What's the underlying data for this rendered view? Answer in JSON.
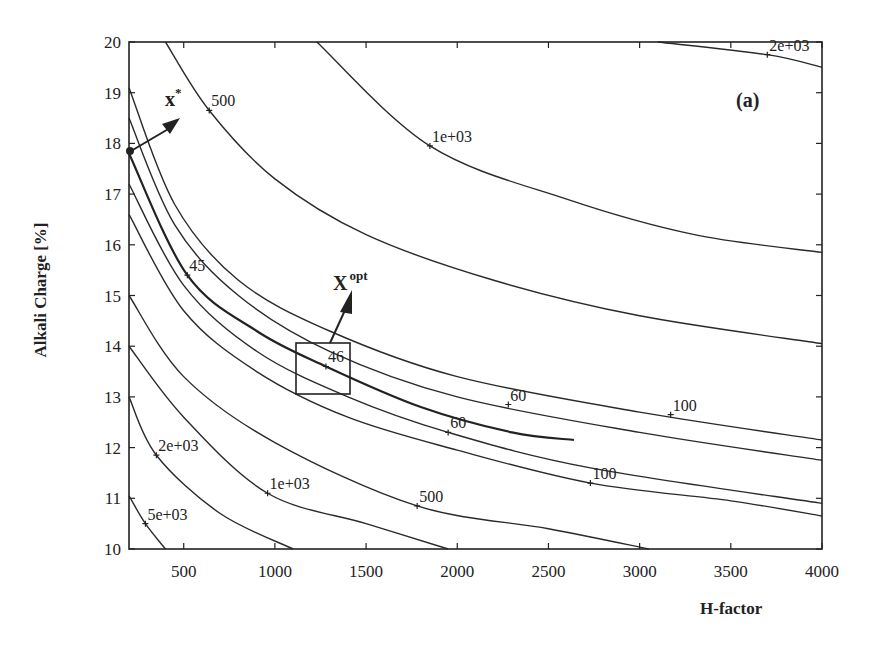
{
  "chart_data": {
    "type": "contour",
    "title": "",
    "panel_label": "(a)",
    "xlabel": "H-factor",
    "ylabel": "Alkali Charge [%]",
    "xlim": [
      200,
      4000
    ],
    "ylim": [
      10,
      20
    ],
    "xticks": [
      500,
      1000,
      1500,
      2000,
      2500,
      3000,
      3500,
      4000
    ],
    "yticks": [
      10,
      11,
      12,
      13,
      14,
      15,
      16,
      17,
      18,
      19,
      20
    ],
    "grid": false,
    "contour_labels": [
      {
        "text": "500",
        "x": 640,
        "y": 18.65
      },
      {
        "text": "1e+03",
        "x": 1850,
        "y": 17.95
      },
      {
        "text": "2e+03",
        "x": 3700,
        "y": 19.75
      },
      {
        "text": "45",
        "x": 520,
        "y": 15.4
      },
      {
        "text": "46",
        "x": 1280,
        "y": 13.6
      },
      {
        "text": "60",
        "x": 2280,
        "y": 12.85
      },
      {
        "text": "60",
        "x": 1950,
        "y": 12.3
      },
      {
        "text": "100",
        "x": 3170,
        "y": 12.65
      },
      {
        "text": "100",
        "x": 2730,
        "y": 11.3
      },
      {
        "text": "2e+03",
        "x": 350,
        "y": 11.85
      },
      {
        "text": "1e+03",
        "x": 960,
        "y": 11.1
      },
      {
        "text": "500",
        "x": 1780,
        "y": 10.85
      },
      {
        "text": "5e+03",
        "x": 290,
        "y": 10.5
      }
    ],
    "contours": [
      {
        "level": "2e+03 (upper)",
        "points": [
          [
            3100,
            20.0
          ],
          [
            3700,
            19.75
          ],
          [
            4000,
            19.5
          ]
        ]
      },
      {
        "level": "1e+03 (upper)",
        "points": [
          [
            1230,
            20.0
          ],
          [
            1850,
            17.95
          ],
          [
            2600,
            16.9
          ],
          [
            3300,
            16.2
          ],
          [
            4000,
            15.85
          ]
        ]
      },
      {
        "level": "500 (upper)",
        "points": [
          [
            400,
            20.0
          ],
          [
            640,
            18.65
          ],
          [
            1000,
            17.3
          ],
          [
            1500,
            16.2
          ],
          [
            2200,
            15.3
          ],
          [
            3000,
            14.6
          ],
          [
            4000,
            14.05
          ]
        ]
      },
      {
        "level": "upper-1",
        "points": [
          [
            200,
            19.1
          ],
          [
            450,
            16.8
          ],
          [
            800,
            15.3
          ],
          [
            1300,
            14.3
          ],
          [
            2000,
            13.4
          ],
          [
            3000,
            12.7
          ],
          [
            4000,
            12.15
          ]
        ]
      },
      {
        "level": "upper-2",
        "points": [
          [
            200,
            18.5
          ],
          [
            450,
            16.4
          ],
          [
            800,
            15.0
          ],
          [
            1300,
            13.9
          ],
          [
            2000,
            13.0
          ],
          [
            3000,
            12.3
          ],
          [
            4000,
            11.75
          ]
        ]
      },
      {
        "level": "45/46 band",
        "points": [
          [
            200,
            17.8
          ],
          [
            520,
            15.4
          ],
          [
            900,
            14.3
          ],
          [
            1280,
            13.6
          ],
          [
            1800,
            12.8
          ],
          [
            2300,
            12.3
          ],
          [
            2640,
            12.15
          ]
        ]
      },
      {
        "level": "60 (lower)",
        "points": [
          [
            200,
            17.2
          ],
          [
            500,
            15.2
          ],
          [
            900,
            13.9
          ],
          [
            1400,
            13.0
          ],
          [
            1950,
            12.3
          ],
          [
            2730,
            11.6
          ],
          [
            4000,
            10.9
          ]
        ]
      },
      {
        "level": "100 (lower)",
        "points": [
          [
            200,
            16.6
          ],
          [
            500,
            14.7
          ],
          [
            900,
            13.5
          ],
          [
            1400,
            12.6
          ],
          [
            2000,
            11.95
          ],
          [
            2730,
            11.3
          ],
          [
            3500,
            10.95
          ],
          [
            4000,
            10.65
          ]
        ]
      },
      {
        "level": "500 (lower)",
        "points": [
          [
            200,
            15.0
          ],
          [
            500,
            13.4
          ],
          [
            1000,
            12.1
          ],
          [
            1780,
            10.85
          ],
          [
            2500,
            10.4
          ],
          [
            3050,
            10.0
          ]
        ]
      },
      {
        "level": "1e+03 (lower)",
        "points": [
          [
            200,
            14.0
          ],
          [
            500,
            12.6
          ],
          [
            960,
            11.1
          ],
          [
            1500,
            10.5
          ],
          [
            1950,
            10.0
          ]
        ]
      },
      {
        "level": "2e+03 (lower)",
        "points": [
          [
            200,
            13.0
          ],
          [
            350,
            11.85
          ],
          [
            700,
            10.7
          ],
          [
            1100,
            10.0
          ]
        ]
      },
      {
        "level": "5e+03",
        "points": [
          [
            200,
            11.05
          ],
          [
            290,
            10.5
          ],
          [
            400,
            10.0
          ]
        ]
      }
    ],
    "annotations": [
      {
        "text": "x*",
        "point": [
          200,
          17.9
        ],
        "label_at": [
          420,
          18.45
        ]
      },
      {
        "text": "X^opt",
        "box": [
          [
            1120,
            13.1
          ],
          [
            1420,
            14.1
          ]
        ],
        "label_at": [
          1450,
          15.6
        ]
      }
    ]
  },
  "labels": {
    "xstar_base": "x",
    "xstar_sup": "*",
    "xopt_base": "X",
    "xopt_sup": "opt"
  }
}
